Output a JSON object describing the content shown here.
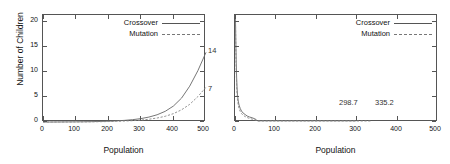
{
  "figure": {
    "panels": [
      {
        "id": "left",
        "xlabel": "Population",
        "ylabel": "Number of Children",
        "xticks": [
          "0",
          "100",
          "200",
          "300",
          "400",
          "500"
        ],
        "yticks": [
          "0",
          "5",
          "10",
          "15",
          "20"
        ],
        "legend": [
          {
            "label": "Crossover",
            "style": "solid"
          },
          {
            "label": "Mutation",
            "style": "dashed"
          }
        ],
        "annotations": [
          {
            "text": "14",
            "series": "Crossover"
          },
          {
            "text": "7",
            "series": "Mutation"
          }
        ]
      },
      {
        "id": "right",
        "xlabel": "Population",
        "ylabel": "",
        "xticks": [
          "0",
          "100",
          "200",
          "300",
          "400",
          "500"
        ],
        "yticks": [
          "",
          "",
          "",
          "",
          ""
        ],
        "legend": [
          {
            "label": "Crossover",
            "style": "solid"
          },
          {
            "label": "Mutation",
            "style": "dashed"
          }
        ],
        "annotations": [
          {
            "text": "298.7",
            "series": "Crossover"
          },
          {
            "text": "335.2",
            "series": "Mutation"
          }
        ]
      }
    ]
  },
  "chart_data": [
    {
      "type": "line",
      "panel": "left",
      "title": "",
      "xlabel": "Population",
      "ylabel": "Number of Children",
      "xlim": [
        0,
        500
      ],
      "ylim": [
        0,
        21.5
      ],
      "xticks": [
        0,
        100,
        200,
        300,
        400,
        500
      ],
      "yticks": [
        0,
        5,
        10,
        15,
        20
      ],
      "grid": false,
      "legend_position": "top-right-inside",
      "annotations": [
        {
          "text": "14",
          "x": 500,
          "y": 14
        },
        {
          "text": "7",
          "x": 500,
          "y": 7
        }
      ],
      "x": [
        0,
        25,
        50,
        75,
        100,
        125,
        150,
        175,
        200,
        225,
        250,
        275,
        300,
        325,
        350,
        375,
        400,
        425,
        450,
        475,
        500
      ],
      "series": [
        {
          "name": "Crossover",
          "style": "solid",
          "values": [
            0.0,
            0.0,
            0.01,
            0.02,
            0.03,
            0.05,
            0.07,
            0.11,
            0.16,
            0.23,
            0.33,
            0.47,
            0.68,
            0.99,
            1.45,
            2.15,
            3.2,
            4.8,
            7.2,
            10.3,
            14.0
          ]
        },
        {
          "name": "Mutation",
          "style": "dashed",
          "values": [
            0.0,
            0.0,
            0.0,
            0.01,
            0.015,
            0.025,
            0.04,
            0.06,
            0.09,
            0.13,
            0.19,
            0.27,
            0.39,
            0.56,
            0.8,
            1.15,
            1.68,
            2.45,
            3.55,
            5.1,
            7.0
          ]
        }
      ]
    },
    {
      "type": "line",
      "panel": "right",
      "title": "",
      "xlabel": "Population",
      "ylabel": "",
      "xlim": [
        0,
        500
      ],
      "ylim": [
        0,
        21.5
      ],
      "xticks": [
        0,
        100,
        200,
        300,
        400,
        500
      ],
      "yticks": [
        0,
        5,
        10,
        15,
        20
      ],
      "grid": false,
      "legend_position": "top-right-inside",
      "annotations": [
        {
          "text": "298.7",
          "x": 298.7,
          "y": 0
        },
        {
          "text": "335.2",
          "x": 335.2,
          "y": 0
        }
      ],
      "series": [
        {
          "name": "Crossover",
          "style": "solid",
          "x": [
            1,
            2,
            3,
            4,
            5,
            6,
            8,
            10,
            13,
            16,
            20,
            25,
            30,
            36,
            44,
            52,
            55,
            298.7
          ],
          "values": [
            21.5,
            16.5,
            12.0,
            9.0,
            7.0,
            5.6,
            4.2,
            3.4,
            2.7,
            2.2,
            1.8,
            1.5,
            1.2,
            1.0,
            0.8,
            0.5,
            0.25,
            0.25
          ]
        },
        {
          "name": "Mutation",
          "style": "dashed",
          "x": [
            1,
            2,
            3,
            4,
            5,
            6,
            8,
            10,
            13,
            16,
            20,
            25,
            30,
            36,
            44,
            52,
            55,
            335.2
          ],
          "values": [
            21.5,
            15.0,
            10.5,
            7.6,
            5.8,
            4.6,
            3.4,
            2.7,
            2.1,
            1.7,
            1.35,
            1.1,
            0.9,
            0.7,
            0.55,
            0.35,
            0.2,
            0.2
          ]
        }
      ]
    }
  ]
}
